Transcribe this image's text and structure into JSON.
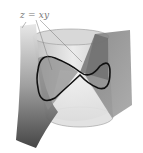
{
  "figure": {
    "label": "z = xy",
    "colors": {
      "sheet_dark": "#4a4a4a",
      "sheet_light": "#d0d0d0",
      "cylinder": "#c8c8c8",
      "curve": "#111111",
      "label": "#777777"
    }
  }
}
